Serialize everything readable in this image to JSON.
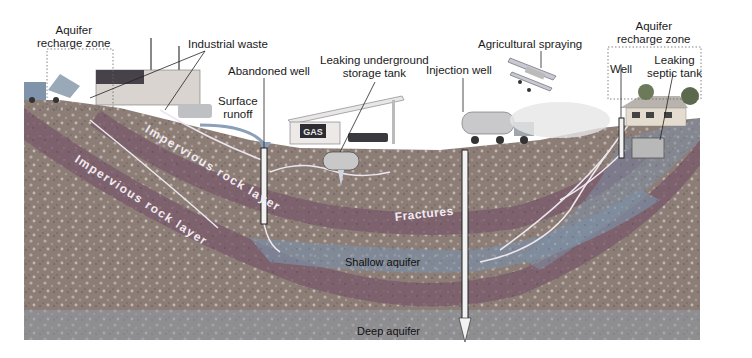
{
  "diagram": {
    "labels": {
      "aquifer_recharge_left": "Aquifer\nrecharge zone",
      "industrial_waste": "Industrial waste",
      "abandoned_well": "Abandoned well",
      "surface_runoff": "Surface\nrunoff",
      "leaking_tank": "Leaking underground\nstorage tank",
      "injection_well": "Injection well",
      "agricultural_spraying": "Agricultural spraying",
      "aquifer_recharge_right": "Aquifer\nrecharge zone",
      "well": "Well",
      "septic_tank": "Leaking\nseptic tank"
    },
    "layers": {
      "impervious_upper": "Impervious rock layer",
      "impervious_lower": "Impervious rock layer",
      "fractures": "Fractures",
      "shallow_aquifer": "Shallow aquifer",
      "deep_aquifer": "Deep aquifer"
    },
    "surface_features": {
      "gas_sign": "GAS"
    },
    "colors": {
      "ground": "#8e7f77",
      "ground_speckle": "#b8aca3",
      "impervious": "#7e6470",
      "aquifer": "#7f8fa6",
      "contaminant_flow": "#e8e2ea",
      "sky": "#ffffff"
    }
  }
}
